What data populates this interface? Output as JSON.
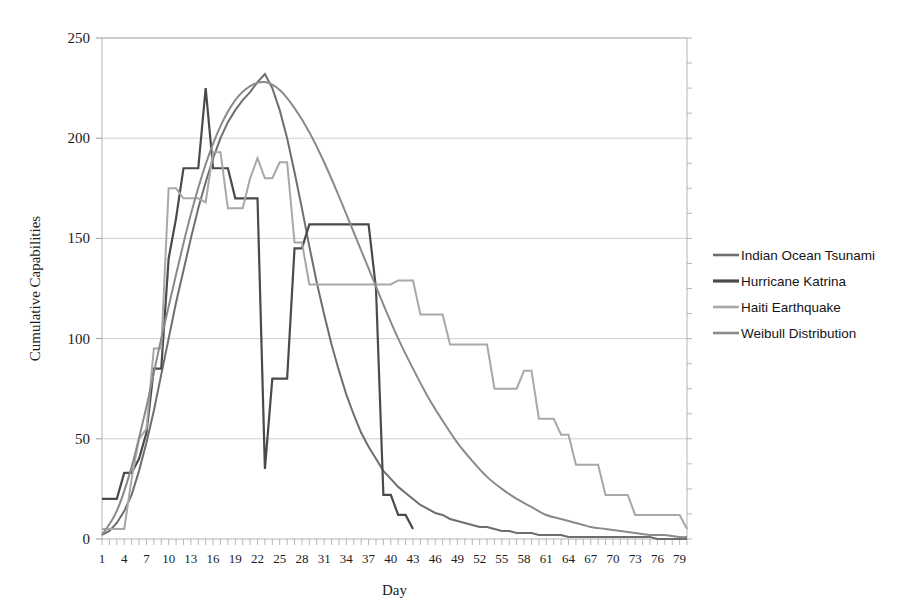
{
  "chart_data": {
    "type": "line",
    "title": "",
    "xlabel": "Day",
    "ylabel": "Cumulative  Capabilities",
    "xlim": [
      1,
      80
    ],
    "ylim": [
      0,
      250
    ],
    "grid": true,
    "legend_position": "right",
    "y_ticks": [
      0,
      50,
      100,
      150,
      200,
      250
    ],
    "x_ticks": [
      1,
      4,
      7,
      10,
      13,
      16,
      19,
      22,
      25,
      28,
      31,
      34,
      37,
      40,
      43,
      46,
      49,
      52,
      55,
      58,
      61,
      64,
      67,
      70,
      73,
      76,
      79
    ],
    "x_minor_step": 1,
    "series": [
      {
        "name": "Indian Ocean Tsunami",
        "color": "#6e6e6e",
        "width": 2.0,
        "x": [
          1,
          2,
          3,
          4,
          5,
          6,
          7,
          8,
          9,
          10,
          11,
          12,
          13,
          14,
          15,
          16,
          17,
          18,
          19,
          20,
          21,
          22,
          23,
          24,
          25,
          26,
          27,
          28,
          29,
          30,
          31,
          32,
          33,
          34,
          35,
          36,
          37,
          38,
          39,
          40,
          41,
          42,
          43,
          44,
          45,
          46,
          47,
          48,
          49,
          50,
          51,
          52,
          53,
          54,
          55,
          56,
          57,
          58,
          59,
          60,
          61,
          62,
          63,
          64,
          65,
          66,
          67,
          68,
          69,
          70,
          71,
          72,
          73,
          74,
          75,
          76,
          77,
          78,
          79,
          80
        ],
        "values": [
          2,
          4,
          8,
          14,
          22,
          34,
          48,
          64,
          82,
          100,
          118,
          134,
          150,
          165,
          178,
          190,
          200,
          208,
          214,
          219,
          223,
          228,
          232,
          225,
          214,
          200,
          183,
          165,
          146,
          128,
          112,
          97,
          84,
          72,
          62,
          53,
          46,
          40,
          34,
          30,
          26,
          23,
          20,
          17,
          15,
          13,
          12,
          10,
          9,
          8,
          7,
          6,
          6,
          5,
          4,
          4,
          3,
          3,
          3,
          2,
          2,
          2,
          2,
          1,
          1,
          1,
          1,
          1,
          1,
          1,
          1,
          1,
          1,
          1,
          1,
          0,
          0,
          0,
          0,
          0
        ]
      },
      {
        "name": "Hurricane Katrina",
        "color": "#4a4a4a",
        "width": 2.2,
        "x": [
          1,
          2,
          3,
          4,
          5,
          6,
          7,
          8,
          9,
          10,
          11,
          12,
          13,
          14,
          15,
          16,
          17,
          18,
          19,
          20,
          21,
          22,
          23,
          24,
          25,
          26,
          27,
          28,
          29,
          30,
          31,
          32,
          33,
          34,
          35,
          36,
          37,
          38,
          39,
          40,
          41,
          42,
          43
        ],
        "values": [
          20,
          20,
          20,
          33,
          33,
          40,
          53,
          85,
          85,
          140,
          160,
          185,
          185,
          185,
          225,
          185,
          185,
          185,
          170,
          170,
          170,
          170,
          35,
          80,
          80,
          80,
          145,
          145,
          157,
          157,
          157,
          157,
          157,
          157,
          157,
          157,
          157,
          125,
          22,
          22,
          12,
          12,
          5
        ]
      },
      {
        "name": "Haiti Earthquake",
        "color": "#a8a8a8",
        "width": 2.0,
        "x": [
          1,
          2,
          3,
          4,
          5,
          6,
          7,
          8,
          9,
          10,
          11,
          12,
          13,
          14,
          15,
          16,
          17,
          18,
          19,
          20,
          21,
          22,
          23,
          24,
          25,
          26,
          27,
          28,
          29,
          30,
          31,
          32,
          33,
          34,
          35,
          36,
          37,
          38,
          39,
          40,
          41,
          42,
          43,
          44,
          45,
          46,
          47,
          48,
          49,
          50,
          51,
          52,
          53,
          54,
          55,
          56,
          57,
          58,
          59,
          60,
          61,
          62,
          63,
          64,
          65,
          66,
          67,
          68,
          69,
          70,
          71,
          72,
          73,
          74,
          75,
          76,
          77,
          78,
          79,
          80
        ],
        "values": [
          5,
          5,
          5,
          5,
          30,
          50,
          55,
          95,
          95,
          175,
          175,
          170,
          170,
          170,
          168,
          193,
          193,
          165,
          165,
          165,
          180,
          190,
          180,
          180,
          188,
          188,
          148,
          148,
          127,
          127,
          127,
          127,
          127,
          127,
          127,
          127,
          127,
          127,
          127,
          127,
          129,
          129,
          129,
          112,
          112,
          112,
          112,
          97,
          97,
          97,
          97,
          97,
          97,
          75,
          75,
          75,
          75,
          84,
          84,
          60,
          60,
          60,
          52,
          52,
          37,
          37,
          37,
          37,
          22,
          22,
          22,
          22,
          12,
          12,
          12,
          12,
          12,
          12,
          12,
          5
        ]
      },
      {
        "name": "Weibull Distribution",
        "color": "#8a8a8a",
        "width": 2.0,
        "smooth": true,
        "x": [
          1,
          3,
          5,
          7,
          9,
          11,
          13,
          15,
          17,
          19,
          21,
          23,
          25,
          27,
          29,
          31,
          33,
          35,
          37,
          39,
          41,
          43,
          45,
          47,
          49,
          51,
          53,
          55,
          57,
          59,
          61,
          63,
          65,
          67,
          69,
          71,
          73,
          75,
          77,
          79,
          80
        ],
        "values": [
          2,
          14,
          36,
          66,
          100,
          132,
          162,
          187,
          206,
          219,
          226,
          228,
          224,
          215,
          203,
          188,
          171,
          153,
          135,
          117,
          100,
          85,
          71,
          59,
          48,
          39,
          31,
          25,
          20,
          16,
          12,
          10,
          8,
          6,
          5,
          4,
          3,
          2,
          2,
          1,
          1
        ]
      }
    ]
  },
  "legend": {
    "items": [
      {
        "label": "Indian Ocean Tsunami",
        "color": "#6e6e6e"
      },
      {
        "label": "Hurricane Katrina",
        "color": "#4a4a4a"
      },
      {
        "label": "Haiti Earthquake",
        "color": "#a8a8a8"
      },
      {
        "label": "Weibull Distribution",
        "color": "#8a8a8a"
      }
    ]
  }
}
